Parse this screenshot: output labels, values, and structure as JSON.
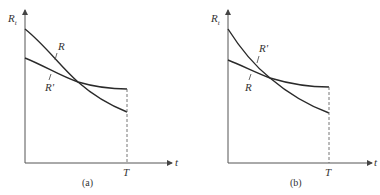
{
  "figure": {
    "panels": [
      {
        "caption": "(a)",
        "y_axis_label": "R",
        "y_axis_subscript": "t",
        "x_axis_label": "t",
        "x_marker_label": "T",
        "curve_steep_label": "R",
        "curve_flat_label": "R'"
      },
      {
        "caption": "(b)",
        "y_axis_label": "R",
        "y_axis_subscript": "t",
        "x_axis_label": "t",
        "x_marker_label": "T",
        "curve_steep_label": "R'",
        "curve_flat_label": "R"
      }
    ]
  },
  "colors": {
    "curve": "#2a2a2a",
    "axis": "#555555",
    "background": "#ffffff"
  }
}
